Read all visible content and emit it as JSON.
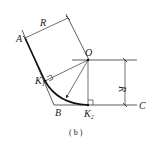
{
  "diagram": {
    "caption": "( b )",
    "labels": {
      "A": "A",
      "B": "B",
      "C": "C",
      "O": "O",
      "K1": "K",
      "K1_sub": "1",
      "K2": "K",
      "K2_sub": "2",
      "R_top": "R",
      "R_right": "R"
    },
    "colors": {
      "line": "#333333",
      "arc": "#111111",
      "background": "#ffffff"
    }
  }
}
